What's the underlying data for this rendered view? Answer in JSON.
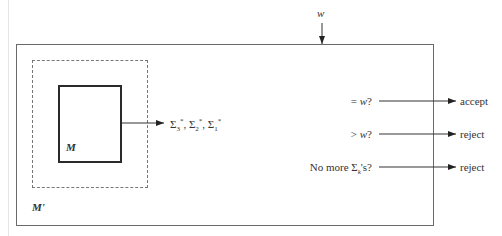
{
  "diagram": {
    "type": "machine-construction-diagram",
    "input": {
      "label": "w"
    },
    "outer_machine": {
      "label": "M'"
    },
    "inner_machine": {
      "label": "M"
    },
    "inner_output": {
      "terms": [
        {
          "base": "Σ",
          "sub": "3",
          "sup": "*"
        },
        {
          "base": "Σ",
          "sub": "2",
          "sup": "*"
        },
        {
          "base": "Σ",
          "sub": "1",
          "sup": "*"
        }
      ],
      "separator": ", "
    },
    "tests": [
      {
        "condition": "= w?",
        "prefix": "= ",
        "var": "w",
        "suffix": "?",
        "result": "accept"
      },
      {
        "condition": "> w?",
        "prefix": "> ",
        "var": "w",
        "suffix": "?",
        "result": "reject"
      },
      {
        "condition": "No more Σk's?",
        "prefix": "No more Σ",
        "sub": "k",
        "suffix": "'s?",
        "result": "reject"
      }
    ]
  }
}
